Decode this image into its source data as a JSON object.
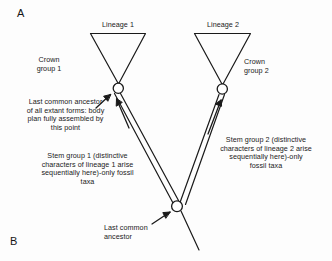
{
  "figure": {
    "panel_a_letter": "A",
    "panel_b_letter": "B"
  },
  "diagram": {
    "type": "phylogenetic-tree",
    "lineage1_label": "Lineage 1",
    "lineage2_label": "Lineage 2",
    "crown_group1_label": "Crown\ngroup 1",
    "crown_group2_label": "Crown\ngroup 2",
    "last_common_ancestor_extant": "Last common ancestor\nof all extant forms: body\nplan fully assembled by\nthis point",
    "stem_group1_label": "Stem group 1 (distinctive\ncharacters of lineage 1 arise\nsequentially here)-only fossil\ntaxa",
    "stem_group2_label": "Stem group 2 (distinctive\ncharacters of lineage 2 arise\nsequentially here)-only\nfossil taxa",
    "last_common_ancestor_label": "Last common\nancestor",
    "line_color": "#1a1a1a",
    "node_fill": "#ffffff",
    "background": "#fdfdfd"
  }
}
